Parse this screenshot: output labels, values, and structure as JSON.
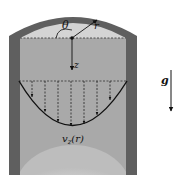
{
  "figure": {
    "type": "diagram",
    "labels": {
      "theta": "θ",
      "r": "r",
      "z": "z",
      "g": "g",
      "velocity": "v",
      "velocity_sub": "z",
      "velocity_arg": "(r)"
    },
    "colors": {
      "wall": "#5f5f5f",
      "fluid": "#a9a9a9",
      "headspace": "#d4d4d4",
      "bottom_glow": "#dcdcdc",
      "line": "#111111"
    },
    "profile": {
      "arrow_count": 7,
      "shape": "parabolic"
    }
  }
}
